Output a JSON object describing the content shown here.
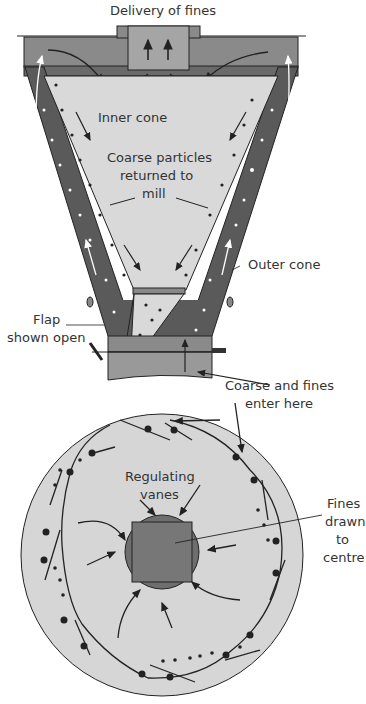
{
  "diagram": {
    "labels": {
      "delivery": "Delivery of fines",
      "inner_cone": "Inner cone",
      "coarse_returned_1": "Coarse particles",
      "coarse_returned_2": "returned to",
      "coarse_returned_3": "mill",
      "outer_cone": "Outer cone",
      "flap_1": "Flap",
      "flap_2": "shown open",
      "enter_1": "Coarse and fines",
      "enter_2": "enter here",
      "vanes_1": "Regulating",
      "vanes_2": "vanes",
      "fines_1": "Fines",
      "fines_2": "drawn",
      "fines_3": "to",
      "fines_4": "centre"
    },
    "colors": {
      "outer_wall": "#5a5a5a",
      "inner_fill": "#d9d9d9",
      "top_box": "#8a8a8a",
      "plan_fill": "#d6d6d6",
      "centre": "#6e6e6e",
      "stroke": "#222222"
    }
  }
}
